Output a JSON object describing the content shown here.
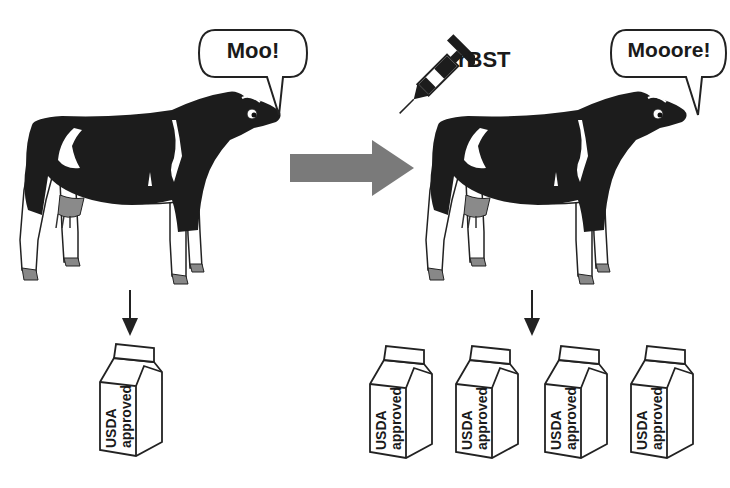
{
  "diagram": {
    "left_panel": {
      "speech_bubble": "Moo!",
      "cartons": [
        {
          "line1": "USDA",
          "line2": "approved"
        }
      ]
    },
    "transition_arrow": {
      "direction": "right",
      "color": "#7a7a7a"
    },
    "right_panel": {
      "injection_label": "rBST",
      "speech_bubble": "Mooore!",
      "cartons": [
        {
          "line1": "USDA",
          "line2": "approved"
        },
        {
          "line1": "USDA",
          "line2": "approved"
        },
        {
          "line1": "USDA",
          "line2": "approved"
        },
        {
          "line1": "USDA",
          "line2": "approved"
        }
      ]
    },
    "colors": {
      "cow_black": "#1c1c1c",
      "udder_gray": "#8a8a8a",
      "outline": "#222222",
      "arrow_gray": "#7a7a7a"
    }
  }
}
